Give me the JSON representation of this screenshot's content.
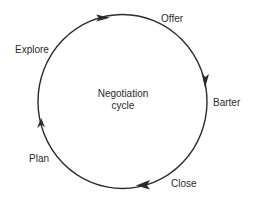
{
  "diagram": {
    "title": "Negotiation cycle",
    "center_label_line1": "Negotiation",
    "center_label_line2": "cycle",
    "stages": [
      {
        "label": "Offer"
      },
      {
        "label": "Barter"
      },
      {
        "label": "Close"
      },
      {
        "label": "Plan"
      },
      {
        "label": "Explore"
      }
    ],
    "direction": "clockwise",
    "stroke_color": "#2a2a2a",
    "background_color": "#ffffff"
  }
}
